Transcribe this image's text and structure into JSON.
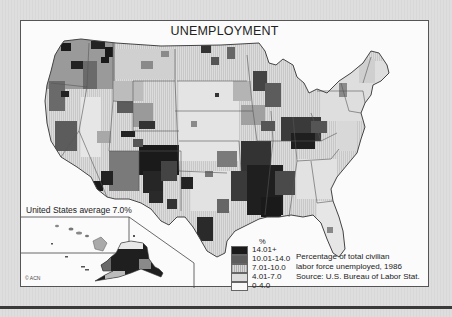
{
  "title": "UNEMPLOYMENT",
  "average_label": "United States average 7.0%",
  "legend": {
    "unit": "%",
    "classes": [
      {
        "label": "14.01+",
        "color": "#1a1a1a"
      },
      {
        "label": "10.01-14.0",
        "color": "#5c5c5c"
      },
      {
        "label": "7.01-10.0",
        "color": "#a8a8a8"
      },
      {
        "label": "4.01-7.0",
        "color": "#dcdcdc"
      },
      {
        "label": "0-4.0",
        "color": "#f8f8f8"
      }
    ]
  },
  "caption": {
    "line1": "Percentage of total civilian",
    "line2": "labor force unemployed, 1986",
    "source": "Source: U.S. Bureau of Labor Stat."
  },
  "copyright": "© ACN",
  "insets": [
    "Hawaii",
    "Alaska"
  ],
  "colors": {
    "background": "#dcdcdc",
    "panel": "#fbfbfb",
    "outline": "#444444"
  }
}
